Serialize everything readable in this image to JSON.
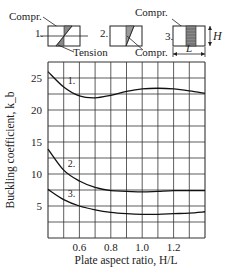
{
  "chart_data": {
    "type": "line",
    "title": "",
    "xlabel": "Plate aspect ratio, H/L",
    "ylabel": "Buckling coefficient, k_b",
    "xlim": [
      0.4,
      1.4
    ],
    "ylim": [
      0,
      27.5
    ],
    "grid": true,
    "x_ticks": [
      "0.6",
      "0.8",
      "1.0",
      "1.2"
    ],
    "y_ticks": [
      "5",
      "10",
      "15",
      "20",
      "25"
    ],
    "series": [
      {
        "name": "1.",
        "x": [
          0.4,
          0.5,
          0.6,
          0.7,
          0.8,
          0.9,
          1.0,
          1.1,
          1.2,
          1.3,
          1.4
        ],
        "values": [
          26.0,
          23.6,
          22.2,
          21.9,
          22.3,
          22.9,
          23.3,
          23.4,
          23.3,
          23.0,
          22.6
        ]
      },
      {
        "name": "2.",
        "x": [
          0.4,
          0.5,
          0.6,
          0.7,
          0.8,
          0.9,
          1.0,
          1.1,
          1.2,
          1.3,
          1.4
        ],
        "values": [
          13.9,
          10.6,
          8.9,
          7.9,
          7.4,
          7.3,
          7.2,
          7.3,
          7.4,
          7.4,
          7.4
        ]
      },
      {
        "name": "3.",
        "x": [
          0.4,
          0.5,
          0.6,
          0.7,
          0.8,
          0.9,
          1.0,
          1.1,
          1.2,
          1.3,
          1.4
        ],
        "values": [
          7.6,
          6.0,
          5.0,
          4.4,
          4.0,
          3.8,
          3.7,
          3.7,
          3.8,
          3.9,
          4.1
        ]
      }
    ],
    "annotations": {
      "case1": {
        "label": "1.",
        "top_note": "Compr.",
        "bottom_note": "Tension"
      },
      "case2": {
        "label": "2.",
        "bottom_note": "Compr."
      },
      "case3": {
        "label": "3.",
        "top_note": "Compr.",
        "height_label": "H",
        "length_label": "L"
      }
    }
  }
}
